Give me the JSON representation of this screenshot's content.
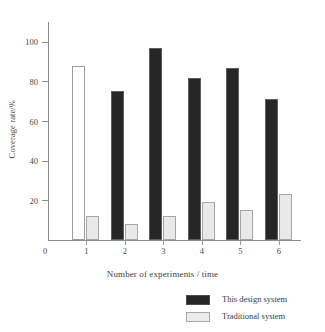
{
  "chart_data": {
    "type": "bar",
    "title": "",
    "subtitle": "",
    "xlabel": "Number of experiments / time",
    "ylabel": "Coverage rate/%",
    "categories": [
      "1",
      "2",
      "3",
      "4",
      "5",
      "6"
    ],
    "series": [
      {
        "name": "This design system",
        "color": "#262626",
        "values": [
          88,
          75,
          97,
          82,
          87,
          71
        ]
      },
      {
        "name": "Traditional system",
        "color": "#e9e9e9",
        "values": [
          12,
          8,
          12,
          19,
          15,
          23
        ]
      }
    ],
    "ylim": [
      0,
      110
    ],
    "y_ticks": [
      20,
      40,
      60,
      80,
      100
    ],
    "y_tick_labels": [
      "20",
      "40",
      "60",
      "80",
      "100"
    ],
    "origin_label": "0",
    "grid": false,
    "legend_position": "bottom-right"
  },
  "axes": {
    "y_axis_title": "Coverage rate/%",
    "x_axis_title": "Number of experiments / time",
    "origin": "0"
  },
  "legend": {
    "entries": [
      {
        "label": "This design system",
        "swatch": "black-filled-swatch"
      },
      {
        "label": "Traditional system",
        "swatch": "light-gray-swatch"
      }
    ]
  }
}
